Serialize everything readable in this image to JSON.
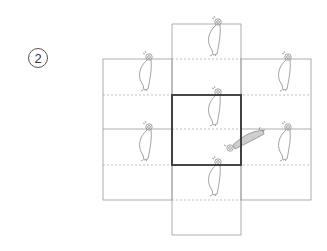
{
  "step": {
    "number": "2"
  },
  "colors": {
    "outline": "#9a9a9a",
    "dashed": "#a8a8a8",
    "highlight_box": "#333333",
    "figure_stroke": "#8a8a8a",
    "rotated_figure_fill": "#cfcfcf"
  },
  "diagram": {
    "grid": {
      "columns_x": [
        103,
        172,
        241,
        311
      ],
      "center_column_y": [
        24,
        235
      ],
      "side_panels_y": [
        59,
        200
      ],
      "solid_lines_y": [
        59,
        129,
        200
      ],
      "dashed_lines_y": [
        59,
        95,
        165,
        200
      ],
      "highlight_box": {
        "x": 172,
        "y": 95,
        "w": 69,
        "h": 70
      }
    },
    "figures": [
      {
        "id": "center-top",
        "x": 210,
        "y": 22
      },
      {
        "id": "left-top",
        "x": 148,
        "y": 57
      },
      {
        "id": "right-top",
        "x": 288,
        "y": 57
      },
      {
        "id": "center-middle",
        "x": 218,
        "y": 92
      },
      {
        "id": "left-bottom",
        "x": 150,
        "y": 127
      },
      {
        "id": "right-bottom",
        "x": 288,
        "y": 127
      },
      {
        "id": "center-bottom",
        "x": 218,
        "y": 162
      }
    ],
    "rotated_figure": {
      "id": "rotated",
      "head_x": 230,
      "head_y": 147
    }
  }
}
